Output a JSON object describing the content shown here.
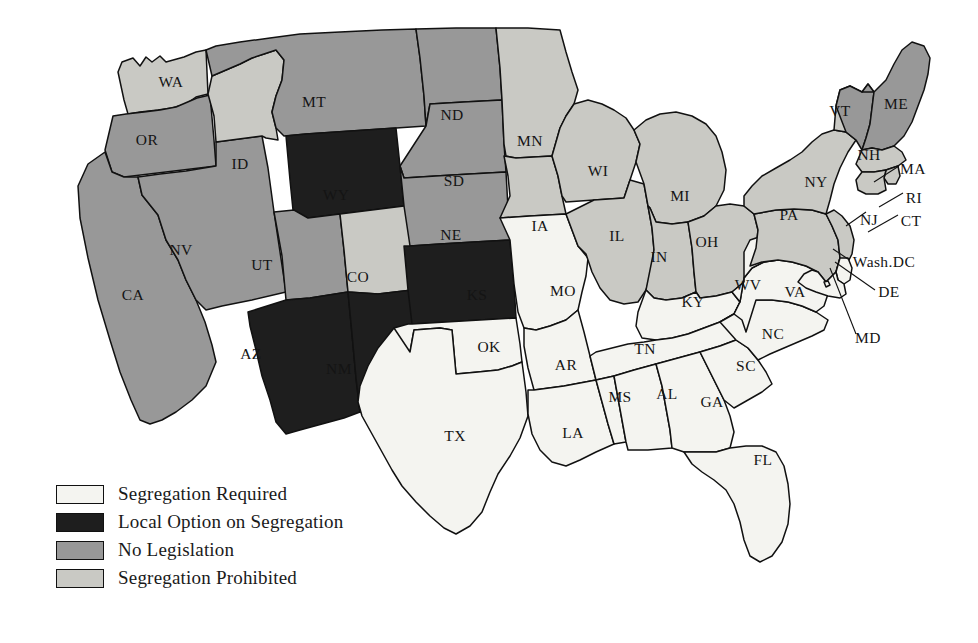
{
  "map": {
    "title": "Segregation Legislation by State",
    "background_color": "#ffffff",
    "border_color": "#111111",
    "categories": [
      {
        "key": "required",
        "label": "Segregation Required",
        "color": "#f4f4f0"
      },
      {
        "key": "local",
        "label": "Local Option on Segregation",
        "color": "#1e1e1e"
      },
      {
        "key": "none",
        "label": "No Legislation",
        "color": "#989898"
      },
      {
        "key": "prohibited",
        "label": "Segregation Prohibited",
        "color": "#c9c9c4"
      }
    ],
    "states": [
      {
        "code": "WA",
        "category": "prohibited",
        "x": 171,
        "y": 83
      },
      {
        "code": "OR",
        "category": "none",
        "x": 147,
        "y": 141
      },
      {
        "code": "CA",
        "category": "none",
        "x": 133,
        "y": 296
      },
      {
        "code": "NV",
        "category": "none",
        "x": 181,
        "y": 251
      },
      {
        "code": "ID",
        "category": "prohibited",
        "x": 240,
        "y": 165
      },
      {
        "code": "MT",
        "category": "none",
        "x": 314,
        "y": 103
      },
      {
        "code": "WY",
        "category": "local",
        "x": 336,
        "y": 196
      },
      {
        "code": "UT",
        "category": "none",
        "x": 262,
        "y": 266
      },
      {
        "code": "AZ",
        "category": "local",
        "x": 251,
        "y": 355
      },
      {
        "code": "CO",
        "category": "prohibited",
        "x": 358,
        "y": 278
      },
      {
        "code": "NM",
        "category": "local",
        "x": 339,
        "y": 370
      },
      {
        "code": "ND",
        "category": "none",
        "x": 452,
        "y": 116
      },
      {
        "code": "SD",
        "category": "none",
        "x": 454,
        "y": 182
      },
      {
        "code": "NE",
        "category": "none",
        "x": 451,
        "y": 236
      },
      {
        "code": "KS",
        "category": "local",
        "x": 477,
        "y": 296
      },
      {
        "code": "OK",
        "category": "required",
        "x": 489,
        "y": 348
      },
      {
        "code": "TX",
        "category": "required",
        "x": 455,
        "y": 437
      },
      {
        "code": "MN",
        "category": "prohibited",
        "x": 530,
        "y": 142
      },
      {
        "code": "IA",
        "category": "prohibited",
        "x": 540,
        "y": 227
      },
      {
        "code": "MO",
        "category": "required",
        "x": 563,
        "y": 292
      },
      {
        "code": "AR",
        "category": "required",
        "x": 566,
        "y": 366
      },
      {
        "code": "LA",
        "category": "required",
        "x": 573,
        "y": 434
      },
      {
        "code": "WI",
        "category": "prohibited",
        "x": 598,
        "y": 172
      },
      {
        "code": "IL",
        "category": "prohibited",
        "x": 617,
        "y": 237
      },
      {
        "code": "MI",
        "category": "prohibited",
        "x": 680,
        "y": 197
      },
      {
        "code": "IN",
        "category": "prohibited",
        "x": 659,
        "y": 258
      },
      {
        "code": "OH",
        "category": "prohibited",
        "x": 707,
        "y": 243
      },
      {
        "code": "KY",
        "category": "required",
        "x": 693,
        "y": 303
      },
      {
        "code": "TN",
        "category": "required",
        "x": 645,
        "y": 350
      },
      {
        "code": "MS",
        "category": "required",
        "x": 620,
        "y": 398
      },
      {
        "code": "AL",
        "category": "required",
        "x": 667,
        "y": 395
      },
      {
        "code": "GA",
        "category": "required",
        "x": 712,
        "y": 403
      },
      {
        "code": "FL",
        "category": "required",
        "x": 763,
        "y": 461
      },
      {
        "code": "SC",
        "category": "required",
        "x": 746,
        "y": 367
      },
      {
        "code": "NC",
        "category": "required",
        "x": 773,
        "y": 335
      },
      {
        "code": "VA",
        "category": "required",
        "x": 795,
        "y": 293
      },
      {
        "code": "WV",
        "category": "required",
        "x": 748,
        "y": 286
      },
      {
        "code": "PA",
        "category": "prohibited",
        "x": 789,
        "y": 216
      },
      {
        "code": "NY",
        "category": "prohibited",
        "x": 816,
        "y": 183
      },
      {
        "code": "VT",
        "category": "prohibited",
        "x": 840,
        "y": 112
      },
      {
        "code": "NH",
        "category": "none",
        "x": 869,
        "y": 156
      },
      {
        "code": "ME",
        "category": "none",
        "x": 896,
        "y": 105
      },
      {
        "code": "MA",
        "category": "prohibited",
        "x": 913,
        "y": 170
      },
      {
        "code": "RI",
        "category": "prohibited",
        "x": 914,
        "y": 199
      },
      {
        "code": "CT",
        "category": "prohibited",
        "x": 911,
        "y": 222
      },
      {
        "code": "NJ",
        "category": "prohibited",
        "x": 869,
        "y": 221
      },
      {
        "code": "DE",
        "category": "required",
        "x": 889,
        "y": 293
      },
      {
        "code": "MD",
        "category": "required",
        "x": 868,
        "y": 339
      },
      {
        "code": "DC",
        "category": "required",
        "x": 884,
        "y": 263
      }
    ],
    "callout_labels": [
      {
        "code": "MA",
        "text": "MA",
        "x": 913,
        "y": 170
      },
      {
        "code": "RI",
        "text": "RI",
        "x": 914,
        "y": 199
      },
      {
        "code": "CT",
        "text": "CT",
        "x": 911,
        "y": 222
      },
      {
        "code": "NJ",
        "text": "NJ",
        "x": 869,
        "y": 221
      },
      {
        "code": "Wash.DC",
        "text": "Wash.DC",
        "x": 884,
        "y": 263
      },
      {
        "code": "DE",
        "text": "DE",
        "x": 889,
        "y": 293
      },
      {
        "code": "MD",
        "text": "MD",
        "x": 868,
        "y": 339
      }
    ]
  },
  "legend": {
    "items": [
      {
        "label": "Segregation Required",
        "color": "#f4f4f0"
      },
      {
        "label": "Local Option on Segregation",
        "color": "#1e1e1e"
      },
      {
        "label": "No Legislation",
        "color": "#989898"
      },
      {
        "label": "Segregation Prohibited",
        "color": "#c9c9c4"
      }
    ]
  }
}
